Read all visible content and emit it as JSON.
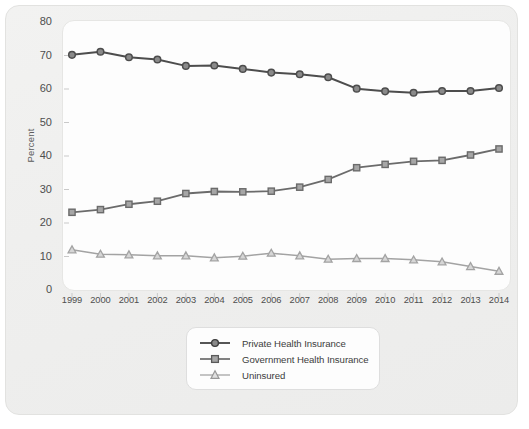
{
  "chart_data": {
    "type": "line",
    "title": "",
    "xlabel": "",
    "ylabel": "Percent",
    "ylim": [
      0,
      80
    ],
    "ytick_step": 10,
    "yticks": [
      "0",
      "10",
      "20",
      "30",
      "40",
      "50",
      "60",
      "70",
      "80"
    ],
    "grid": false,
    "legend_position": "below-center",
    "categories": [
      "1999",
      "2000",
      "2001",
      "2002",
      "2003",
      "2004",
      "2005",
      "2006",
      "2007",
      "2008",
      "2009",
      "2010",
      "2011",
      "2012",
      "2013",
      "2014"
    ],
    "series": [
      {
        "name": "Private Health Insurance",
        "marker": "circle",
        "color": "#4d4d4d",
        "marker_fill": "#8a8a8a",
        "values": [
          70.2,
          71.1,
          69.5,
          68.8,
          66.9,
          67.0,
          66.0,
          64.9,
          64.4,
          63.5,
          60.1,
          59.3,
          58.9,
          59.4,
          59.4,
          60.3
        ]
      },
      {
        "name": "Government Health Insurance",
        "marker": "square",
        "color": "#6b6b6b",
        "marker_fill": "#a6a6a6",
        "values": [
          23.2,
          24.0,
          25.6,
          26.5,
          28.8,
          29.4,
          29.3,
          29.5,
          30.7,
          33.0,
          36.5,
          37.5,
          38.4,
          38.7,
          40.3,
          42.1
        ]
      },
      {
        "name": "Uninsured",
        "marker": "triangle",
        "color": "#a3a3a3",
        "marker_fill": "#d6d6d6",
        "values": [
          12.0,
          10.7,
          10.5,
          10.2,
          10.2,
          9.6,
          10.1,
          11.0,
          10.2,
          9.2,
          9.4,
          9.4,
          9.0,
          8.4,
          7.0,
          5.6
        ]
      }
    ]
  },
  "colors": {
    "card_background": "#efefee",
    "panel_background": "#fdfdfd",
    "axis_text": "#4e4e4e",
    "tick_mark": "#c9c9c9"
  }
}
